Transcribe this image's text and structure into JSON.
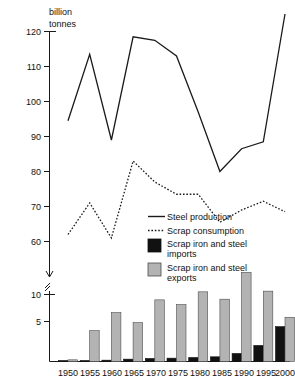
{
  "chart_data": {
    "type": "line",
    "title": "",
    "subtitle": "",
    "unit_label_line1": "billion",
    "unit_label_line2": "tonnes",
    "ylabel": "billion tonnes",
    "xlabel": "",
    "grid": false,
    "legend_position": "middle-right",
    "axis_break": true,
    "x": [
      1950,
      1955,
      1960,
      1965,
      1970,
      1975,
      1980,
      1985,
      1990,
      1995,
      2000
    ],
    "categories": [
      "1950",
      "1955",
      "1960",
      "1965",
      "1970",
      "1975",
      "1980",
      "1985",
      "1990",
      "1995",
      "2000"
    ],
    "upper_panel": {
      "ylim": [
        55,
        126
      ],
      "yticks": [
        60,
        70,
        80,
        90,
        100,
        110,
        120
      ],
      "ytick_labels": [
        "60",
        "70",
        "80",
        "90",
        "100",
        "110",
        "120"
      ],
      "series": [
        {
          "name": "Steel production",
          "style": "solid-line",
          "values": [
            94.5,
            113.5,
            89.0,
            118.5,
            117.5,
            113.0,
            97.0,
            80.0,
            86.5,
            88.5,
            125.0
          ]
        },
        {
          "name": "Scrap consumption",
          "style": "dotted-line",
          "values": [
            62.0,
            71.0,
            61.0,
            83.0,
            77.0,
            73.5,
            73.5,
            65.5,
            69.0,
            71.5,
            68.5
          ]
        }
      ]
    },
    "lower_panel": {
      "ylim": [
        0,
        13.8
      ],
      "yticks": [
        5,
        10
      ],
      "ytick_labels": [
        "5",
        "10"
      ],
      "series": [
        {
          "name": "Scrap iron and steel imports",
          "style": "bar-black",
          "color": "#111111",
          "values": [
            0.15,
            0.15,
            0.2,
            0.35,
            0.45,
            0.5,
            0.6,
            0.7,
            1.2,
            2.4,
            5.2
          ]
        },
        {
          "name": "Scrap iron and steel exports",
          "style": "bar-gray",
          "color": "#b3b3b3",
          "values": [
            0.25,
            4.6,
            7.3,
            5.8,
            9.2,
            8.5,
            10.4,
            9.3,
            13.3,
            10.5,
            6.6
          ]
        }
      ]
    },
    "legend": [
      {
        "label": "Steel production",
        "marker": "solid-line",
        "color": "#1a1a1a"
      },
      {
        "label": "Scrap consumption",
        "marker": "dotted-line",
        "color": "#1a1a1a"
      },
      {
        "label": "Scrap iron and steel imports",
        "marker": "black-square",
        "color": "#111111"
      },
      {
        "label": "Scrap iron and steel exports",
        "marker": "gray-square",
        "color": "#b3b3b3"
      }
    ]
  },
  "legend_text": {
    "steel_production": "Steel production",
    "scrap_consumption": "Scrap consumption",
    "imports_line1": "Scrap iron and steel",
    "imports_line2": "imports",
    "exports_line1": "Scrap iron and steel",
    "exports_line2": "exports"
  },
  "axis": {
    "unit_line1": "billion",
    "unit_line2": "tonnes",
    "y_120": "120",
    "y_110": "110",
    "y_100": "100",
    "y_90": "90",
    "y_80": "80",
    "y_70": "70",
    "y_60": "60",
    "y_10": "10",
    "y_5": "5",
    "x_1950": "1950",
    "x_1955": "1955",
    "x_1960": "1960",
    "x_1965": "1965",
    "x_1970": "1970",
    "x_1975": "1975",
    "x_1980": "1980",
    "x_1985": "1985",
    "x_1990": "1990",
    "x_1995": "1995",
    "x_2000": "2000"
  },
  "colors": {
    "ink": "#1a1a1a",
    "bar_export": "#b3b3b3",
    "bar_import": "#111111",
    "background": "#ffffff"
  }
}
